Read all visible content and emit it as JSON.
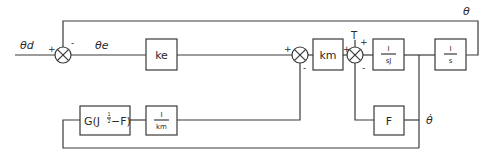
{
  "diagram": {
    "type": "block-diagram",
    "signals": {
      "input": "θd",
      "error": "θe",
      "output": "θ",
      "velocity": "θ̇",
      "torque": "T"
    },
    "blocks": {
      "ke": "ke",
      "km": "km",
      "sJ_num": "I",
      "sJ_den": "sJ",
      "s_num": "I",
      "s_den": "s",
      "F": "F",
      "G_prefix": "G(J",
      "G_exp": "1/2",
      "G_exp_num": "1",
      "G_exp_den": "2",
      "G_suffix": "−F)",
      "inv_km_num": "I",
      "inv_km_den": "km"
    },
    "signs": {
      "sum1_in": "+",
      "sum1_fb": "-",
      "sum2_in": "+",
      "sum2_fb": "-",
      "sum3_in": "+",
      "sum3_T": "+",
      "sum3_fb": "-"
    }
  }
}
